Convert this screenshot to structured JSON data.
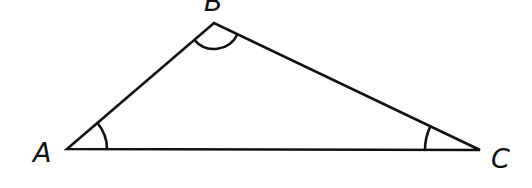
{
  "diagram": {
    "type": "triangle",
    "vertices": [
      {
        "label": "A",
        "x": 67,
        "y": 149
      },
      {
        "label": "B",
        "x": 214,
        "y": 23
      },
      {
        "label": "C",
        "x": 480,
        "y": 150
      }
    ],
    "angle_marks": [
      "A",
      "B",
      "C"
    ],
    "stroke_color": "#111111"
  }
}
